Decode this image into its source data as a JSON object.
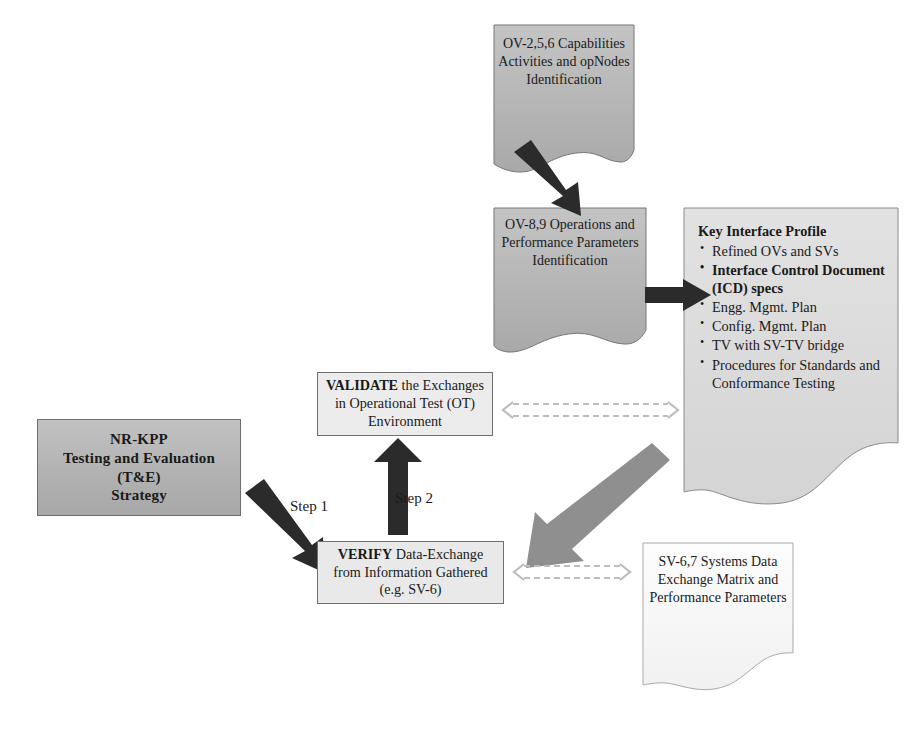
{
  "diagram": {
    "colors": {
      "dark_box_fill": "#b4b4b4",
      "light_box_fill": "#ebebeb",
      "paper_fill": "#b6b6b6",
      "paper_light_fill": "#fbfbfb",
      "black_arrow": "#262626",
      "gray_arrow": "#8f8f8f",
      "dashed_arrow": "#b9b9b9",
      "border": "#6f6f6f"
    }
  },
  "nodes": {
    "ov_256": {
      "title": "OV-2,5,6",
      "lines": [
        "Capabilities",
        "Activities and",
        "opNodes",
        "Identification"
      ]
    },
    "ov_89": {
      "title": "OV-8,9",
      "lines": [
        "Operations and",
        "Performance",
        "Parameters",
        "Identification"
      ]
    },
    "key_interface_profile": {
      "header": "Key Interface Profile",
      "bullets": [
        {
          "text": "Refined OVs and SVs",
          "bold": false
        },
        {
          "text": "Interface Control Document (ICD) specs",
          "bold": true
        },
        {
          "text": "Engg. Mgmt. Plan",
          "bold": false
        },
        {
          "text": "Config. Mgmt. Plan",
          "bold": false
        },
        {
          "text": "TV with SV-TV bridge",
          "bold": false
        },
        {
          "text": "Procedures for Standards and Conformance Testing",
          "bold": false
        }
      ]
    },
    "nr_kpp": {
      "lines": [
        "NR-KPP",
        "Testing and Evaluation",
        "(T&E)",
        "Strategy"
      ]
    },
    "validate": {
      "line1_bold": "VALIDATE",
      "line1_rest": " the Exchanges",
      "line2": "in Operational Test (OT)",
      "line3": "Environment"
    },
    "verify": {
      "line1_bold": "VERIFY",
      "line1_rest": " Data-Exchange",
      "line2": "from Information Gathered",
      "line3": "(e.g. SV-6)"
    },
    "sv_67": {
      "title": "SV-6,7",
      "lines": [
        "Systems Data",
        "Exchange Matrix",
        "and",
        "Performance",
        "Parameters"
      ]
    }
  },
  "labels": {
    "step1": "Step 1",
    "step2": "Step 2"
  },
  "connectors": [
    {
      "name": "ov256-to-ov89",
      "style": "solid-black-thick",
      "from": "ov_256",
      "to": "ov_89"
    },
    {
      "name": "ov89-to-kip",
      "style": "solid-black-thick",
      "from": "ov_89",
      "to": "key_interface_profile"
    },
    {
      "name": "nrkpp-to-verify",
      "style": "solid-black-thick",
      "from": "nr_kpp",
      "to": "verify",
      "label": "Step 1"
    },
    {
      "name": "verify-to-validate",
      "style": "solid-black-thick",
      "from": "verify",
      "to": "validate",
      "label": "Step 2"
    },
    {
      "name": "kip-to-verify",
      "style": "solid-gray-thick",
      "from": "key_interface_profile",
      "to": "verify"
    },
    {
      "name": "validate-to-kip",
      "style": "dashed-gray-double",
      "from": "validate",
      "to": "key_interface_profile"
    },
    {
      "name": "verify-to-sv67",
      "style": "dashed-gray-double",
      "from": "verify",
      "to": "sv_67"
    }
  ]
}
